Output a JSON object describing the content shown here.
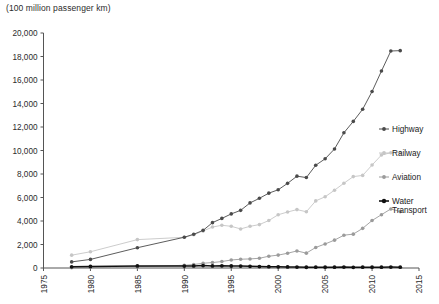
{
  "chart_data": {
    "type": "line",
    "title": "(100 million passenger km)",
    "xlabel": "",
    "ylabel": "",
    "unit_note": "(100 million passenger km)",
    "xlim": [
      1975,
      2015
    ],
    "ylim": [
      0,
      20000
    ],
    "xticks": [
      1975,
      1980,
      1985,
      1990,
      1995,
      2000,
      2005,
      2010,
      2015
    ],
    "yticks": [
      0,
      2000,
      4000,
      6000,
      8000,
      10000,
      12000,
      14000,
      16000,
      18000,
      20000
    ],
    "ytick_labels": [
      "0",
      "2,000",
      "4,000",
      "6,000",
      "8,000",
      "10,000",
      "12,000",
      "14,000",
      "16,000",
      "18,000",
      "20,000"
    ],
    "xtick_labels": [
      "1975",
      "1980",
      "1985",
      "1990",
      "1995",
      "2000",
      "2005",
      "2010",
      "2015"
    ],
    "grid": false,
    "legend_position": "right",
    "series": [
      {
        "name": "Highway",
        "color": "#4a4a4a",
        "marker": "circle",
        "x": [
          1978,
          1980,
          1985,
          1990,
          1991,
          1992,
          1993,
          1994,
          1995,
          1996,
          1997,
          1998,
          1999,
          2000,
          2001,
          2002,
          2003,
          2004,
          2005,
          2006,
          2007,
          2008,
          2009,
          2010,
          2011,
          2012,
          2013
        ],
        "y": [
          521,
          730,
          1726,
          2620,
          2870,
          3203,
          3860,
          4220,
          4603,
          4906,
          5540,
          5930,
          6370,
          6657,
          7206,
          7815,
          7696,
          8748,
          9292,
          10131,
          11506,
          12476,
          13512,
          15021,
          16760,
          18468,
          18500
        ]
      },
      {
        "name": "Railway",
        "color": "#c6c6c6",
        "marker": "circle",
        "x": [
          1978,
          1980,
          1985,
          1990,
          1991,
          1992,
          1993,
          1994,
          1995,
          1996,
          1997,
          1998,
          1999,
          2000,
          2001,
          2002,
          2003,
          2004,
          2005,
          2006,
          2007,
          2008,
          2009,
          2010,
          2011,
          2012,
          2013
        ],
        "y": [
          1093,
          1383,
          2416,
          2613,
          2828,
          3152,
          3484,
          3636,
          3547,
          3325,
          3548,
          3695,
          4041,
          4533,
          4767,
          4969,
          4787,
          5712,
          6062,
          6622,
          7216,
          7778,
          7879,
          8762,
          9612,
          9812,
          9820
        ]
      },
      {
        "name": "Aviation",
        "color": "#9b9b9b",
        "marker": "circle",
        "x": [
          1978,
          1980,
          1985,
          1990,
          1991,
          1992,
          1993,
          1994,
          1995,
          1996,
          1997,
          1998,
          1999,
          2000,
          2001,
          2002,
          2003,
          2004,
          2005,
          2006,
          2007,
          2008,
          2009,
          2010,
          2011,
          2012,
          2013
        ],
        "y": [
          28,
          40,
          117,
          230,
          295,
          405,
          464,
          551,
          681,
          748,
          772,
          829,
          1002,
          1097,
          1255,
          1453,
          1265,
          1751,
          2045,
          2371,
          2792,
          2882,
          3375,
          4039,
          4537,
          5026,
          4800
        ]
      },
      {
        "name": "Water Transport",
        "color": "#111111",
        "marker": "circle",
        "x": [
          1978,
          1980,
          1985,
          1990,
          1991,
          1992,
          1993,
          1994,
          1995,
          1996,
          1997,
          1998,
          1999,
          2000,
          2001,
          2002,
          2003,
          2004,
          2005,
          2006,
          2007,
          2008,
          2009,
          2010,
          2011,
          2012,
          2013
        ],
        "y": [
          101,
          129,
          179,
          165,
          180,
          203,
          176,
          185,
          172,
          161,
          141,
          121,
          109,
          101,
          90,
          81,
          63,
          66,
          68,
          73,
          78,
          59,
          69,
          72,
          69,
          77,
          68
        ]
      }
    ]
  },
  "legend": {
    "items": [
      {
        "label": "Highway",
        "color": "#4a4a4a"
      },
      {
        "label": "Railway",
        "color": "#c6c6c6"
      },
      {
        "label": "Aviation",
        "color": "#9b9b9b"
      },
      {
        "label": "Water",
        "label2": "Transport",
        "color": "#111111"
      }
    ]
  },
  "legend_labels": {
    "highway": "Highway",
    "railway": "Railway",
    "aviation": "Aviation",
    "water_1": "Water",
    "water_2": "Transport"
  }
}
